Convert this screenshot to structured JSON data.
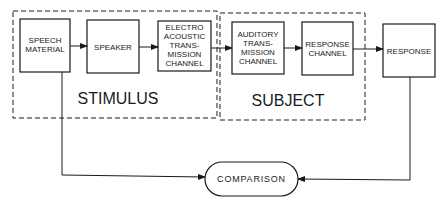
{
  "diagram": {
    "groups": [
      {
        "id": "stimulus",
        "label": "STIMULUS"
      },
      {
        "id": "subject",
        "label": "SUBJECT"
      }
    ],
    "blocks": [
      {
        "id": "speech-material",
        "lines": [
          "SPEECH",
          "MATERIAL"
        ]
      },
      {
        "id": "speaker",
        "lines": [
          "SPEAKER"
        ]
      },
      {
        "id": "electro-acoustic",
        "lines": [
          "ELECTRO",
          "ACOUSTIC",
          "TRANS-",
          "MISSION",
          "CHANNEL"
        ]
      },
      {
        "id": "auditory",
        "lines": [
          "AUDITORY",
          "TRANS-",
          "MISSION",
          "CHANNEL"
        ]
      },
      {
        "id": "response-channel",
        "lines": [
          "RESPONSE",
          "CHANNEL"
        ]
      },
      {
        "id": "response",
        "lines": [
          "RESPONSE"
        ]
      }
    ],
    "comparison": {
      "label": "COMPARISON"
    },
    "colors": {
      "stroke": "#1a1a1a",
      "background": "#ffffff"
    }
  }
}
